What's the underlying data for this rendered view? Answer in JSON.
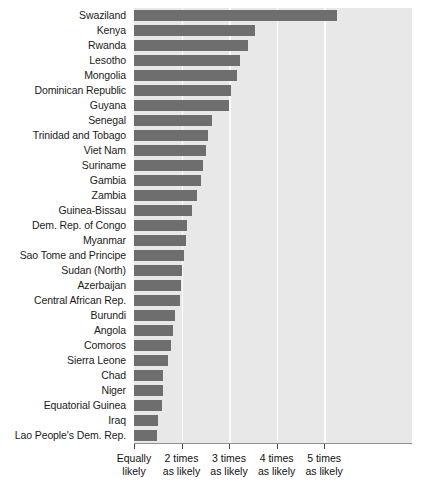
{
  "chart_data": {
    "type": "bar",
    "orientation": "horizontal",
    "title": "",
    "xlabel": "",
    "ylabel": "",
    "xlim": [
      1,
      6.85
    ],
    "grid": true,
    "legend": null,
    "bar_color": "#6e6e6e",
    "plot_background": "#e8e8e8",
    "gridline_color": "#fbfbfb",
    "axis_tick_values": [
      1,
      2,
      3,
      4,
      5
    ],
    "axis_tick_labels": [
      {
        "line1": "Equally",
        "line2": "likely"
      },
      {
        "line1": "2 times",
        "line2": "as likely"
      },
      {
        "line1": "3 times",
        "line2": "as likely"
      },
      {
        "line1": "4 times",
        "line2": "as likely"
      },
      {
        "line1": "5 times",
        "line2": "as likely"
      }
    ],
    "categories": [
      "Swaziland",
      "Kenya",
      "Rwanda",
      "Lesotho",
      "Mongolia",
      "Dominican Republic",
      "Guyana",
      "Senegal",
      "Trinidad and Tobago",
      "Viet Nam",
      "Suriname",
      "Gambia",
      "Zambia",
      "Guinea-Bissau",
      "Dem. Rep. of Congo",
      "Myanmar",
      "Sao Tome and Principe",
      "Sudan (North)",
      "Azerbaijan",
      "Central African Rep.",
      "Burundi",
      "Angola",
      "Comoros",
      "Sierra Leone",
      "Chad",
      "Niger",
      "Equatorial Guinea",
      "Iraq",
      "Lao People's Dem. Rep."
    ],
    "values": [
      5.28,
      3.54,
      3.39,
      3.24,
      3.16,
      3.05,
      2.99,
      2.65,
      2.55,
      2.51,
      2.46,
      2.42,
      2.32,
      2.21,
      2.12,
      2.1,
      2.05,
      2.02,
      1.99,
      1.96,
      1.86,
      1.83,
      1.78,
      1.72,
      1.62,
      1.6,
      1.58,
      1.5,
      1.49
    ]
  }
}
